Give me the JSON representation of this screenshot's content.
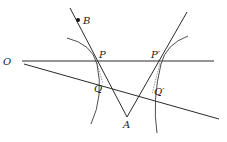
{
  "figure": {
    "type": "geometric-optics-diagram",
    "labels": {
      "O": "O",
      "B": "B",
      "P": "P",
      "P_prime": "P′",
      "Q": "Q",
      "Q_prime": "Q′",
      "A": "A"
    },
    "points": {
      "O": [
        10,
        61
      ],
      "B": [
        78,
        20
      ],
      "P": [
        96,
        61
      ],
      "P_prime": [
        161,
        61
      ],
      "Q": [
        103,
        86
      ],
      "Q_prime": [
        148,
        98
      ],
      "A": [
        127,
        117
      ]
    },
    "colors": {
      "line": "#2a2a2a",
      "background": "#ffffff"
    }
  }
}
